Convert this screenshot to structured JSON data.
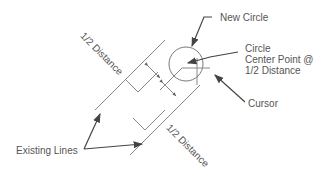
{
  "diagram": {
    "labels": {
      "new_circle": "New Circle",
      "center_line1": "Circle",
      "center_line2": "Center Point @",
      "center_line3": "1/2 Distance",
      "cursor": "Cursor",
      "existing_lines": "Existing Lines",
      "half_distance_top": "1/2 Distance",
      "half_distance_bottom": "1/2 Distance"
    },
    "colors": {
      "line": "#777777",
      "text": "#555555",
      "arrow": "#444444"
    }
  }
}
